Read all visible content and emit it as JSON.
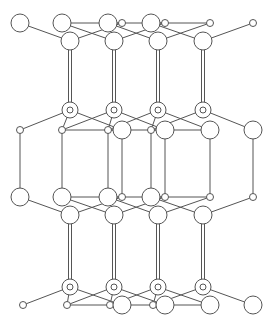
{
  "figure": {
    "caption": "",
    "colors": {
      "line": "#555555",
      "atom_fill": "#ffffff",
      "background": "#ffffff"
    }
  },
  "diagram": {
    "type": "crystal-structure",
    "columns_x": [
      70,
      114,
      158,
      203
    ],
    "rows": [
      {
        "name": "row-a-large",
        "y": 23,
        "r": 9,
        "x": [
          20,
          62,
          108,
          151
        ]
      },
      {
        "name": "row-a-small",
        "y": 23,
        "r": 3.5,
        "x": [
          122,
          165,
          210,
          253
        ]
      },
      {
        "name": "row-b-large",
        "y": 41,
        "r": 9,
        "x": [
          70,
          114,
          158,
          203
        ]
      },
      {
        "name": "ring-upper",
        "y": 110,
        "r": 8,
        "inner_r": 3,
        "x": [
          70,
          114,
          158,
          203
        ]
      },
      {
        "name": "row-c-small",
        "y": 130,
        "r": 3.5,
        "x": [
          20,
          62,
          108,
          151
        ]
      },
      {
        "name": "row-c-large",
        "y": 130,
        "r": 9,
        "x": [
          122,
          165,
          210,
          253
        ]
      },
      {
        "name": "row-d-large",
        "y": 197,
        "r": 9,
        "x": [
          20,
          62,
          108,
          151
        ]
      },
      {
        "name": "row-d-small",
        "y": 197,
        "r": 3.5,
        "x": [
          122,
          165,
          210,
          253
        ]
      },
      {
        "name": "row-e-large",
        "y": 215,
        "r": 9,
        "x": [
          70,
          114,
          158,
          203
        ]
      },
      {
        "name": "ring-lower",
        "y": 287,
        "r": 8,
        "inner_r": 3,
        "x": [
          70,
          114,
          158,
          203
        ]
      },
      {
        "name": "row-f-small",
        "y": 305,
        "r": 3.5,
        "x": [
          23,
          67,
          110,
          153
        ]
      },
      {
        "name": "row-f-large",
        "y": 305,
        "r": 9,
        "x": [
          122,
          165,
          210,
          253
        ]
      }
    ]
  }
}
